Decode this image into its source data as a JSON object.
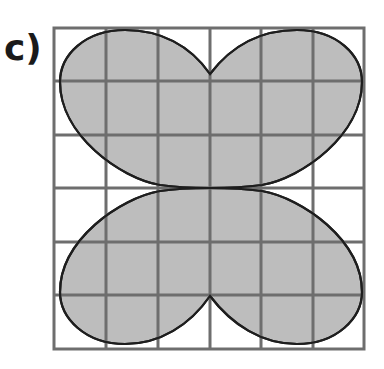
{
  "figure": {
    "label": "c)",
    "grid": {
      "rows": 6,
      "cols": 6,
      "x0": 54,
      "y0": 28,
      "x1": 364,
      "y1": 349,
      "line_color": "#6e6e6e"
    },
    "shape": {
      "description": "Four-lobed shaded region on a 6x6 grid",
      "fill_color": "#bdbdbd",
      "stroke_color": "#1e1e1e"
    }
  }
}
